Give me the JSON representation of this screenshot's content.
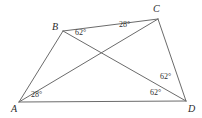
{
  "figure": {
    "kind": "geometry-diagram",
    "background_color": "#ffffff",
    "stroke_color": "#6b6b6b",
    "label_color": "#2b2b2b",
    "stroke_width": 1,
    "width": 202,
    "height": 118
  },
  "vertices": [
    {
      "name": "A",
      "label": "A",
      "x": 19,
      "y": 102,
      "label_x": 11,
      "label_y": 104
    },
    {
      "name": "B",
      "label": "B",
      "x": 63,
      "y": 31,
      "label_x": 52,
      "label_y": 22
    },
    {
      "name": "C",
      "label": "C",
      "x": 158,
      "y": 19,
      "label_x": 153,
      "label_y": 4
    },
    {
      "name": "D",
      "label": "D",
      "x": 186,
      "y": 101,
      "label_x": 188,
      "label_y": 104
    }
  ],
  "edges": [
    {
      "name": "side-AB",
      "from": "A",
      "to": "B"
    },
    {
      "name": "side-BC",
      "from": "B",
      "to": "C"
    },
    {
      "name": "side-CD",
      "from": "C",
      "to": "D"
    },
    {
      "name": "side-AD",
      "from": "A",
      "to": "D"
    },
    {
      "name": "diagonal-AC",
      "from": "A",
      "to": "C"
    },
    {
      "name": "diagonal-BD",
      "from": "B",
      "to": "D"
    }
  ],
  "diagonal_intersection": {
    "x": 105,
    "y": 53
  },
  "angle_labels": [
    {
      "name": "angle-at-B",
      "value": "62",
      "degree_symbol": "°",
      "text": "62°",
      "x": 75,
      "y": 29,
      "at_vertex": "B",
      "between": "BA-and-BD"
    },
    {
      "name": "angle-at-C",
      "value": "28",
      "degree_symbol": "°",
      "text": "28°",
      "x": 119,
      "y": 21,
      "at_vertex": "C",
      "between": "CB-and-CA"
    },
    {
      "name": "angle-at-A",
      "value": "28",
      "degree_symbol": "°",
      "text": "28°",
      "x": 31,
      "y": 91,
      "at_vertex": "A",
      "between": "AC-and-AD"
    },
    {
      "name": "angle-at-D-upper",
      "value": "62",
      "degree_symbol": "°",
      "text": "62°",
      "x": 160,
      "y": 73,
      "at_vertex": "D",
      "between": "DC-and-DB"
    },
    {
      "name": "angle-at-D-lower",
      "value": "62",
      "degree_symbol": "°",
      "text": "62°",
      "x": 150,
      "y": 89,
      "at_vertex": "D",
      "between": "DB-and-DA"
    }
  ]
}
